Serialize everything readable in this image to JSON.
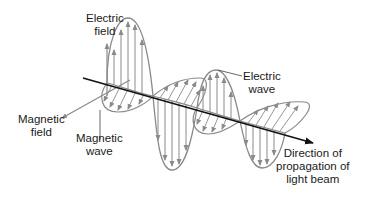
{
  "diagram": {
    "labels": {
      "electric_field": [
        "Electric",
        "field"
      ],
      "electric_wave": [
        "Electric",
        "wave"
      ],
      "magnetic_field": [
        "Magnetic",
        "field"
      ],
      "magnetic_wave": [
        "Magnetic",
        "wave"
      ],
      "propagation": [
        "Direction of",
        "propagation of",
        "light beam"
      ]
    },
    "colors": {
      "axis": "#111111",
      "wave_stroke": "#8a8a8a",
      "label_text": "#1a1a1a",
      "background": "#ffffff"
    }
  }
}
